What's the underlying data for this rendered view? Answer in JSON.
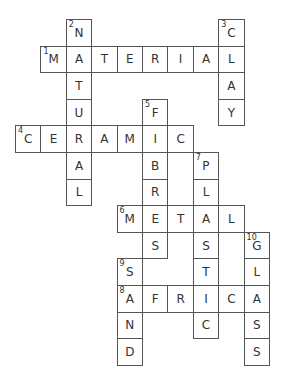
{
  "puzzle": {
    "type": "crossword",
    "grid": {
      "origin_x": 15,
      "origin_y": 19,
      "cell_w": 25.4,
      "cell_h": 26.6
    },
    "words": [
      {
        "number": 1,
        "direction": "across",
        "answer": "MATERIAL",
        "row": 1,
        "col": 1
      },
      {
        "number": 2,
        "direction": "down",
        "answer": "NATURAL",
        "row": 0,
        "col": 2
      },
      {
        "number": 3,
        "direction": "down",
        "answer": "CLAY",
        "row": 0,
        "col": 8
      },
      {
        "number": 4,
        "direction": "across",
        "answer": "CERAMIC",
        "row": 4,
        "col": 0
      },
      {
        "number": 5,
        "direction": "down",
        "answer": "FIBRES",
        "row": 3,
        "col": 5
      },
      {
        "number": 6,
        "direction": "across",
        "answer": "METAL",
        "row": 7,
        "col": 4
      },
      {
        "number": 7,
        "direction": "down",
        "answer": "PLASTIC",
        "row": 5,
        "col": 7
      },
      {
        "number": 8,
        "direction": "across",
        "answer": "AFRICA",
        "row": 10,
        "col": 4
      },
      {
        "number": 9,
        "direction": "down",
        "answer": "SAND",
        "row": 9,
        "col": 4
      },
      {
        "number": 10,
        "direction": "down",
        "answer": "GLASS",
        "row": 8,
        "col": 9
      }
    ]
  }
}
